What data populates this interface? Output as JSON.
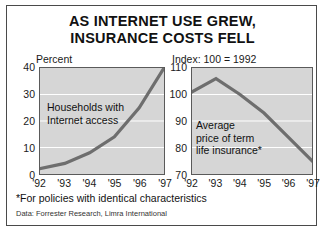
{
  "title": {
    "line1": "AS INTERNET USE GREW,",
    "line2": "INSURANCE COSTS FELL"
  },
  "footnote": "*For policies with identical characteristics",
  "source": "Data: Forrester Research, Limra International",
  "colors": {
    "panel_background": "#d6d6d6",
    "gridline": "#ffffff",
    "line": "#6e6e6e",
    "border": "#5a5a5a",
    "text": "#111111",
    "page_background": "#ffffff"
  },
  "chart_data": [
    {
      "type": "line",
      "id": "internet-use",
      "title": "",
      "ylabel": "Percent",
      "xlabel": "",
      "categories": [
        "'92",
        "'93",
        "'94",
        "'95",
        "'96",
        "'97"
      ],
      "x": [
        1992,
        1993,
        1994,
        1995,
        1996,
        1997
      ],
      "values": [
        2,
        4,
        8,
        14,
        25,
        40
      ],
      "yticks": [
        0,
        10,
        20,
        30,
        40
      ],
      "ylim": [
        0,
        40
      ],
      "grid": true,
      "legend": "none",
      "annotation": {
        "line1": "Households with",
        "line2": "Internet access"
      }
    },
    {
      "type": "line",
      "id": "insurance-price",
      "title": "",
      "ylabel": "Index: 100 = 1992",
      "xlabel": "",
      "categories": [
        "'92",
        "'93",
        "'94",
        "'95",
        "'96",
        "'97"
      ],
      "x": [
        1992,
        1993,
        1994,
        1995,
        1996,
        1997
      ],
      "values": [
        101,
        106,
        100,
        93,
        84,
        75
      ],
      "yticks": [
        70,
        80,
        90,
        100,
        110
      ],
      "ylim": [
        70,
        110
      ],
      "grid": true,
      "legend": "none",
      "annotation": {
        "line1": "Average",
        "line2": "price of term",
        "line3": "life insurance*"
      }
    }
  ]
}
